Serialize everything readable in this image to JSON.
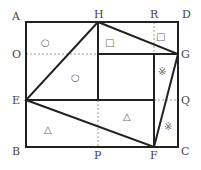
{
  "diagram": {
    "type": "geometry",
    "points": {
      "A": "A",
      "H": "H",
      "R": "R",
      "D": "D",
      "O": "O",
      "G": "G",
      "E": "E",
      "Q": "Q",
      "B": "B",
      "P": "P",
      "F": "F",
      "C": "C"
    },
    "symbols": {
      "circle": "○",
      "square": "□",
      "triangle": "△",
      "asterisk": "※"
    },
    "colors": {
      "line": "#222222",
      "dashed": "#999999",
      "symbol": "#666666"
    }
  }
}
